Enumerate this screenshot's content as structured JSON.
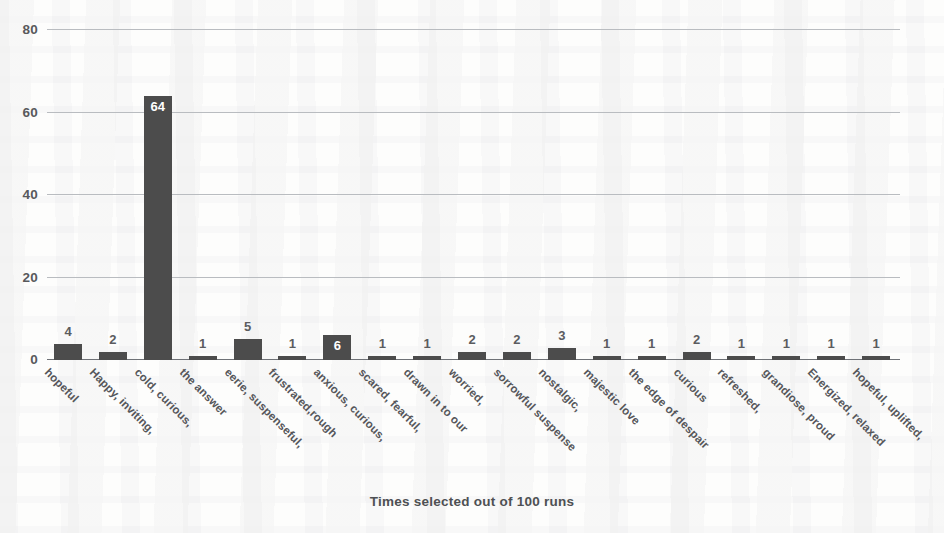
{
  "chart_data": {
    "type": "bar",
    "title": "",
    "subtitle": "",
    "xlabel": "Times selected out of 100 runs",
    "ylabel": "",
    "ylim": [
      0,
      80
    ],
    "yticks": [
      0,
      20,
      40,
      60,
      80
    ],
    "grid": true,
    "legend": false,
    "bar_color": "#4c4c4c",
    "categories": [
      "hopeful",
      "Happy, inviting,",
      "cold, curious,",
      "the answer",
      "eerie, suspenseful,",
      "frustrated,rough",
      "anxious, curious,",
      "scared, fearful,",
      "drawn in to our",
      "worried,",
      "sorrowful suspense",
      "nostalgic,",
      "majestic love",
      "the edge of despair",
      "curious",
      "refreshed,",
      "grandiose, proud",
      "Energized, relaxed",
      "hopeful, uplifted,"
    ],
    "values": [
      4,
      2,
      64,
      1,
      5,
      1,
      6,
      1,
      1,
      2,
      2,
      3,
      1,
      1,
      2,
      1,
      1,
      1,
      1
    ]
  },
  "axis": {
    "y_tick_0": "0",
    "y_tick_20": "20",
    "y_tick_40": "40",
    "y_tick_60": "60",
    "y_tick_80": "80",
    "x_title": "Times selected out of 100 runs"
  }
}
